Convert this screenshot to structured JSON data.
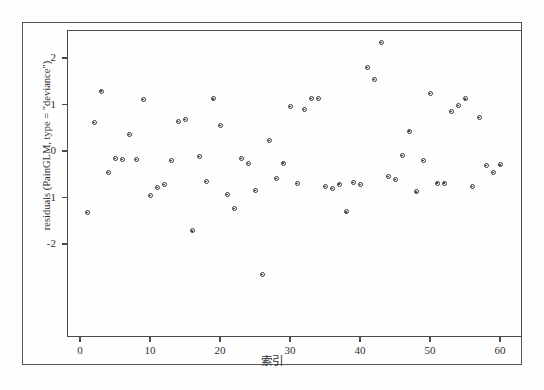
{
  "chart_data": {
    "type": "scatter",
    "title": "",
    "xlabel": "索引",
    "ylabel": "residuals (PainGLM, type = \"deviance\")",
    "xlim": [
      -1.5,
      63
    ],
    "ylim": [
      -2.85,
      2.55
    ],
    "xticks": [
      0,
      10,
      20,
      30,
      40,
      50,
      60
    ],
    "yticks": [
      2,
      1,
      0,
      -1,
      -2
    ],
    "grid": false,
    "legend": null,
    "marker": "open-circle",
    "marker_color": "#3a3a3a",
    "x": [
      1,
      2,
      3,
      4,
      5,
      6,
      7,
      8,
      9,
      10,
      11,
      12,
      13,
      14,
      15,
      16,
      17,
      18,
      19,
      20,
      21,
      22,
      23,
      24,
      25,
      26,
      27,
      28,
      29,
      30,
      31,
      32,
      33,
      34,
      35,
      36,
      37,
      38,
      39,
      40,
      41,
      42,
      43,
      44,
      45,
      46,
      47,
      48,
      49,
      50,
      51,
      52,
      53,
      54,
      55,
      56,
      57,
      58,
      59,
      60
    ],
    "y": [
      -1.33,
      0.62,
      1.29,
      -0.46,
      -0.17,
      -0.19,
      0.35,
      -0.19,
      1.11,
      -0.96,
      -0.78,
      -0.72,
      -0.2,
      0.63,
      0.67,
      -1.72,
      -0.12,
      -0.66,
      1.12,
      0.55,
      -0.94,
      -1.24,
      -0.16,
      -0.27,
      -0.85,
      -2.66,
      0.23,
      -0.6,
      -0.26,
      0.95,
      -0.7,
      0.9,
      1.13,
      1.13,
      -0.76,
      -0.8,
      -0.71,
      -1.31,
      -0.68,
      -0.72,
      1.79,
      1.53,
      2.33,
      -0.54,
      -0.61,
      -0.1,
      0.43,
      -0.88,
      -0.21,
      1.23,
      -0.69,
      -0.69,
      0.85,
      0.98,
      1.12,
      -0.77,
      0.72,
      -0.32,
      -0.46,
      -0.3
    ]
  }
}
